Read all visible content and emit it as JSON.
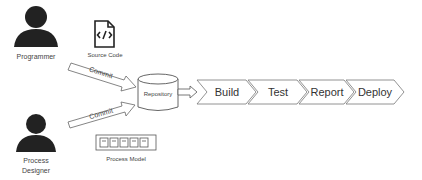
{
  "actors": [
    {
      "id": "programmer",
      "label": "Programmer"
    },
    {
      "id": "process-designer",
      "label_line1": "Process",
      "label_line2": "Designer"
    }
  ],
  "artifacts": {
    "source_code": {
      "label": "Source Code",
      "icon": "code-file-icon"
    },
    "process_model": {
      "label": "Process Model",
      "icon": "process-model-icon"
    }
  },
  "arrows": {
    "commit_top": "Commit",
    "commit_bottom": "Commit"
  },
  "repository": {
    "label": "Repository"
  },
  "pipeline": {
    "stages": [
      {
        "label": "Build"
      },
      {
        "label": "Test"
      },
      {
        "label": "Report"
      },
      {
        "label": "Deploy"
      }
    ]
  }
}
